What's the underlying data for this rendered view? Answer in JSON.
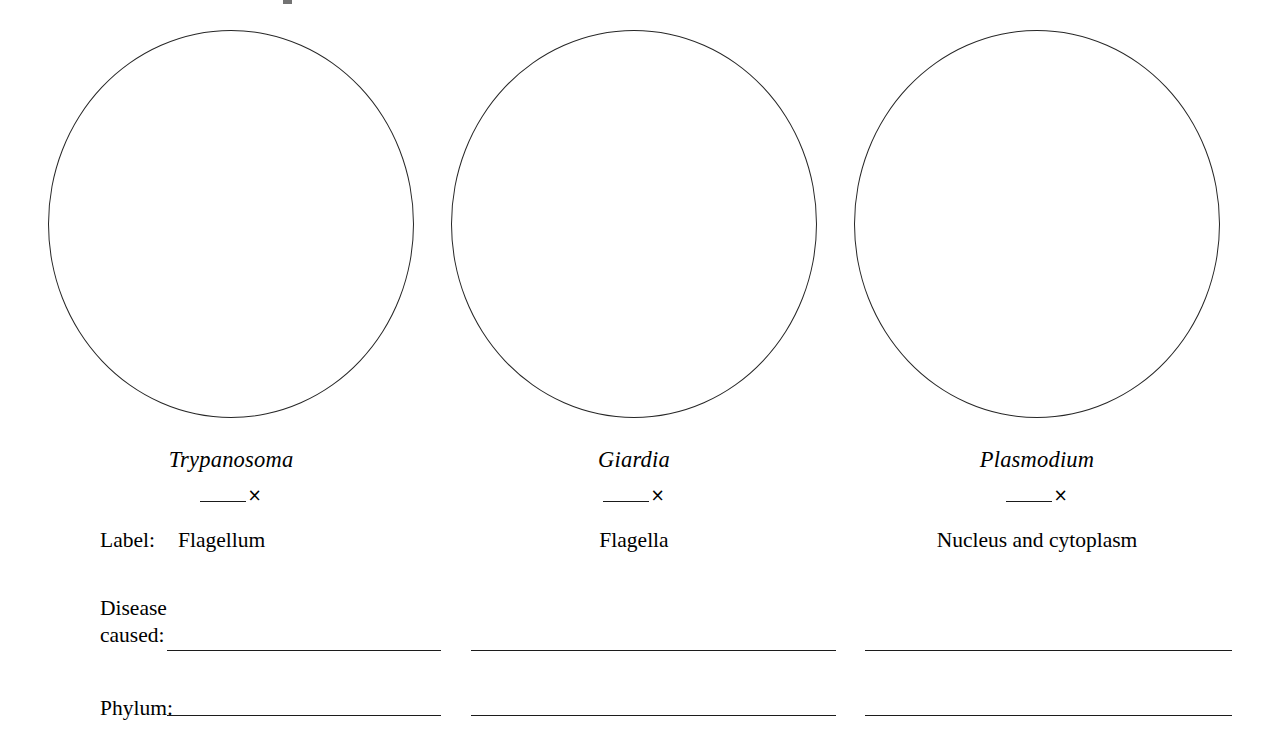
{
  "page": {
    "background_color": "#ffffff",
    "ink_color": "#000000"
  },
  "row_prompts": {
    "label": "Label:",
    "disease_line1": "Disease",
    "disease_line2": "caused:",
    "phylum": "Phylum:"
  },
  "magnification": {
    "blank": "____",
    "times_symbol": "×"
  },
  "specimens": [
    {
      "genus": "Trypanosoma",
      "structure_label": "Flagellum",
      "magnification_value": "",
      "disease_caused": "",
      "phylum": ""
    },
    {
      "genus": "Giardia",
      "structure_label": "Flagella",
      "magnification_value": "",
      "disease_caused": "",
      "phylum": ""
    },
    {
      "genus": "Plasmodium",
      "structure_label": "Nucleus and cytoplasm",
      "magnification_value": "",
      "disease_caused": "",
      "phylum": ""
    }
  ]
}
